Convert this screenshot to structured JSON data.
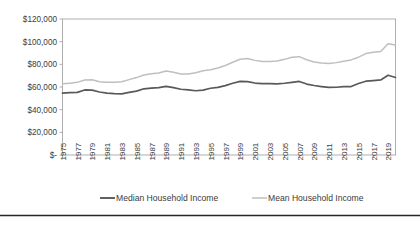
{
  "chart_data": {
    "type": "line",
    "title": "",
    "xlabel": "",
    "ylabel": "",
    "ylim": [
      0,
      120000
    ],
    "ytick_values": [
      0,
      20000,
      40000,
      60000,
      80000,
      100000,
      120000
    ],
    "ytick_labels": [
      "$-",
      "$20,000",
      "$40,000",
      "$60,000",
      "$80,000",
      "$100,000",
      "$120,000"
    ],
    "grid": false,
    "legend_position": "bottom",
    "x": [
      1975,
      1976,
      1977,
      1978,
      1979,
      1980,
      1981,
      1982,
      1983,
      1984,
      1985,
      1986,
      1987,
      1988,
      1989,
      1990,
      1991,
      1992,
      1993,
      1994,
      1995,
      1996,
      1997,
      1998,
      1999,
      2000,
      2001,
      2002,
      2003,
      2004,
      2005,
      2006,
      2007,
      2008,
      2009,
      2010,
      2011,
      2012,
      2013,
      2014,
      2015,
      2016,
      2017,
      2018,
      2019,
      2020
    ],
    "xtick_labels": [
      "1975",
      "1977",
      "1979",
      "1981",
      "1983",
      "1985",
      "1987",
      "1989",
      "1991",
      "1993",
      "1995",
      "1997",
      "1999",
      "2001",
      "2003",
      "2005",
      "2007",
      "2009",
      "2011",
      "2013",
      "2015",
      "2017",
      "2019"
    ],
    "series": [
      {
        "name": "Median Household Income",
        "color": "#595959",
        "values": [
          54600,
          55000,
          55300,
          57400,
          57200,
          55600,
          54600,
          54200,
          54000,
          55200,
          56400,
          58400,
          59000,
          59400,
          60600,
          59500,
          58000,
          57400,
          56700,
          57300,
          58900,
          59700,
          61200,
          63300,
          64900,
          64800,
          63500,
          63000,
          62900,
          62800,
          63300,
          64100,
          64900,
          62600,
          61300,
          60400,
          59600,
          59800,
          60300,
          60400,
          63100,
          65100,
          65700,
          66200,
          70400,
          68400
        ]
      },
      {
        "name": "Mean Household Income",
        "color": "#bfbfbf",
        "values": [
          62800,
          63400,
          64100,
          66200,
          66400,
          64700,
          64100,
          64200,
          64700,
          66500,
          68300,
          70600,
          71700,
          72400,
          74100,
          73000,
          71500,
          71400,
          72600,
          74300,
          75300,
          76700,
          79000,
          81800,
          84500,
          85100,
          83500,
          82400,
          82500,
          83000,
          84400,
          86300,
          86800,
          84000,
          82100,
          81200,
          80700,
          81500,
          82800,
          83900,
          86300,
          89500,
          90700,
          91400,
          98100,
          97000
        ]
      }
    ],
    "legend": [
      {
        "label": "Median Household Income",
        "color": "#595959"
      },
      {
        "label": "Mean Household Income",
        "color": "#bfbfbf"
      }
    ]
  },
  "footer": {
    "rule_color": "#262626"
  }
}
